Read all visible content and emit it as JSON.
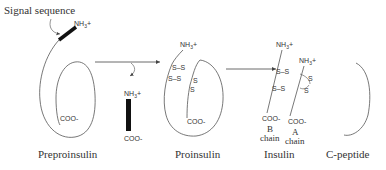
{
  "diagram": {
    "colors": {
      "stroke": "#555555",
      "text": "#333333",
      "signal_bar": "#111111",
      "background": "#ffffff"
    },
    "labels": {
      "signal_sequence": "Signal sequence",
      "preproinsulin": "Preproinsulin",
      "proinsulin": "Proinsulin",
      "insulin": "Insulin",
      "c_peptide": "C-peptide",
      "b_chain_letter": "B",
      "b_chain_word": "chain",
      "a_chain_letter": "A",
      "a_chain_word": "chain"
    },
    "chem": {
      "nh3": "NH",
      "nh3_sub": "3",
      "plus": "+",
      "coo": "COO-",
      "s": "S",
      "ss": "S–S"
    },
    "stages": [
      {
        "name": "Preproinsulin",
        "termini": [
          "NH3+",
          "COO-"
        ],
        "has_signal_sequence": true
      },
      {
        "name": "Cleaved signal sequence",
        "termini": [
          "NH3+",
          "COO-"
        ]
      },
      {
        "name": "Proinsulin",
        "termini": [
          "NH3+",
          "COO-"
        ],
        "disulfide_bonds": 3
      },
      {
        "name": "Insulin",
        "chains": [
          "B chain",
          "A chain"
        ],
        "disulfide_bonds": 3
      },
      {
        "name": "C-peptide"
      }
    ]
  }
}
